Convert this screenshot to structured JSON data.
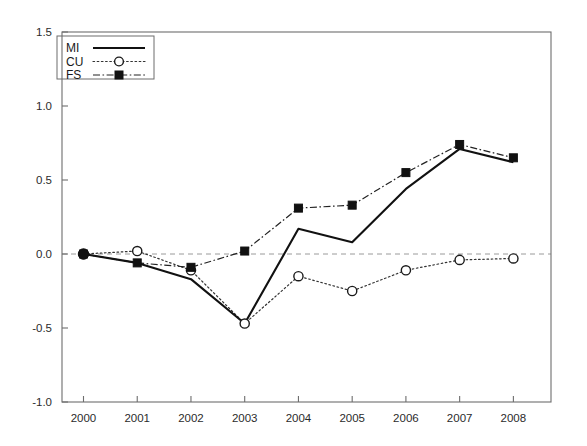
{
  "chart_data": {
    "type": "line",
    "title": "",
    "subtitle": "",
    "xlabel": "",
    "ylabel": "",
    "categories": [
      "2000",
      "2001",
      "2002",
      "2003",
      "2004",
      "2005",
      "2006",
      "2007",
      "2008"
    ],
    "x": [
      2000,
      2001,
      2002,
      2003,
      2004,
      2005,
      2006,
      2007,
      2008
    ],
    "xlim": [
      1999.6,
      2008.7
    ],
    "ylim": [
      -1.0,
      1.5
    ],
    "yticks": [
      1.5,
      1.0,
      0.5,
      0.0,
      -0.5,
      -1.0
    ],
    "ytick_labels": [
      "1.5",
      "1.0",
      "0.5",
      "0.0",
      "-0.5",
      "-1.0"
    ],
    "xtick_labels": [
      "2000",
      "2001",
      "2002",
      "2003",
      "2004",
      "2005",
      "2006",
      "2007",
      "2008"
    ],
    "grid": false,
    "zero_reference_line": 0.0,
    "legend_position": "top-left",
    "series": [
      {
        "name": "MI",
        "style": "solid",
        "marker": "none",
        "values": [
          0.0,
          -0.06,
          -0.17,
          -0.47,
          0.17,
          0.08,
          0.44,
          0.71,
          0.62
        ]
      },
      {
        "name": "CU",
        "style": "dotted",
        "marker": "open-circle",
        "values": [
          0.0,
          0.02,
          -0.11,
          -0.47,
          -0.15,
          -0.25,
          -0.11,
          -0.04,
          -0.03
        ]
      },
      {
        "name": "FS",
        "style": "dash-dot",
        "marker": "filled-square",
        "values": [
          0.0,
          -0.06,
          -0.09,
          0.02,
          0.31,
          0.33,
          0.55,
          0.74,
          0.65
        ]
      }
    ]
  },
  "legend": {
    "entries": [
      {
        "label": "MI",
        "sample": "solid-line-sample"
      },
      {
        "label": "CU",
        "sample": "dotted-circle-sample"
      },
      {
        "label": "FS",
        "sample": "dashdot-square-sample"
      }
    ]
  },
  "colors": {
    "series_mi": "#111111",
    "series_cu": "#333333",
    "series_fs": "#222222",
    "axis": "#6d6d6d",
    "zero_line": "#9a9a9a",
    "background": "#ffffff"
  }
}
